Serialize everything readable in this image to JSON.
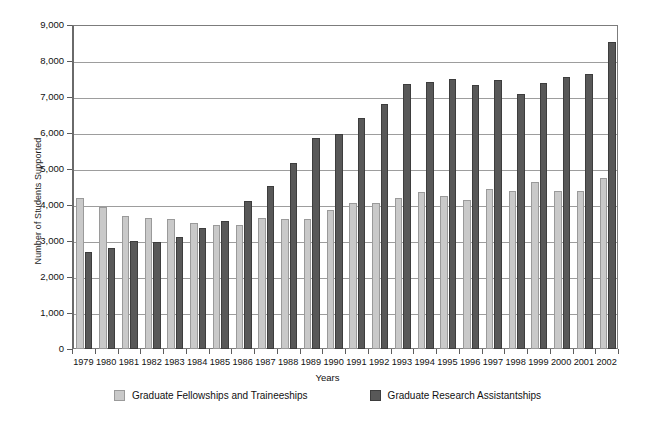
{
  "chart_data": {
    "type": "bar",
    "title": "",
    "xlabel": "Years",
    "ylabel": "Number of Students Supported",
    "ylim": [
      0,
      9000
    ],
    "ytick_step": 1000,
    "grid": true,
    "legend_position": "bottom",
    "ytick_labels": [
      "9,000",
      "8,000",
      "7,000",
      "6,000",
      "5,000",
      "4,000",
      "3,000",
      "2,000",
      "1,000",
      "0"
    ],
    "ytick_values": [
      9000,
      8000,
      7000,
      6000,
      5000,
      4000,
      3000,
      2000,
      1000,
      0
    ],
    "categories": [
      "1979",
      "1980",
      "1981",
      "1982",
      "1983",
      "1984",
      "1985",
      "1986",
      "1987",
      "1988",
      "1989",
      "1990",
      "1991",
      "1992",
      "1993",
      "1994",
      "1995",
      "1996",
      "1997",
      "1998",
      "1999",
      "2000",
      "2001",
      "2002"
    ],
    "series": [
      {
        "name": "Graduate Fellowships and Traineeships",
        "color": "#c9c9c9",
        "values": [
          4200,
          3950,
          3700,
          3650,
          3600,
          3500,
          3450,
          3450,
          3650,
          3600,
          3600,
          3850,
          4050,
          4050,
          4200,
          4350,
          4250,
          4150,
          4450,
          4400,
          4650,
          4400,
          4400,
          4750
        ]
      },
      {
        "name": "Graduate Research Assistantships",
        "color": "#585858",
        "values": [
          2700,
          2800,
          3000,
          2980,
          3100,
          3350,
          3550,
          4100,
          4520,
          5180,
          5870,
          5970,
          6420,
          6800,
          7350,
          7420,
          7500,
          7330,
          7480,
          7070,
          7380,
          7550,
          7640,
          8520
        ]
      }
    ]
  },
  "legend": {
    "items": [
      {
        "label": "Graduate Fellowships and Traineeships",
        "swatch": "light-gray-swatch"
      },
      {
        "label": "Graduate Research Assistantships",
        "swatch": "dark-gray-swatch"
      }
    ]
  }
}
